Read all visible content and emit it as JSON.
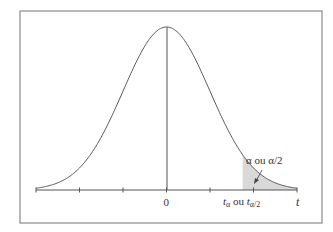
{
  "chart_data": {
    "type": "area",
    "title": "",
    "xlabel": "t",
    "ylabel": "",
    "x_tick_labels": [
      "0",
      "tα ou tα/2"
    ],
    "x_ticks": [
      -3,
      -2,
      -1,
      0,
      1,
      2,
      3
    ],
    "annotation": "α ou α/2",
    "shaded_region": {
      "from": 1.75,
      "to": 3.0,
      "color": "#d9d9d9"
    },
    "curve": {
      "mean": 0,
      "sd": 1,
      "x_range": [
        -3,
        3
      ],
      "peak_height": 0.399
    },
    "grid": false,
    "legend": null
  },
  "labels": {
    "zero": "0",
    "t_axis": "t",
    "t_alpha_base": "t",
    "t_alpha_sub": "α",
    "ou": " ou ",
    "t_alpha2_sub": "α/2",
    "annotation": "α ou α/2"
  },
  "colors": {
    "frame": "#8a8a8a",
    "curve": "#555555",
    "shade": "#d9d9d9",
    "axis": "#555555"
  }
}
